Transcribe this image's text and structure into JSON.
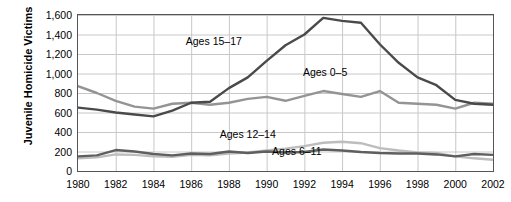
{
  "chart_data": {
    "type": "line",
    "title": "",
    "xlabel": "",
    "ylabel": "Juvenile Homicide Victims",
    "xlim": [
      1980,
      2002
    ],
    "ylim": [
      0,
      1600
    ],
    "grid": true,
    "legend_position": "inline-labels",
    "x": [
      1980,
      1981,
      1982,
      1983,
      1984,
      1985,
      1986,
      1987,
      1988,
      1989,
      1990,
      1991,
      1992,
      1993,
      1994,
      1995,
      1996,
      1997,
      1998,
      1999,
      2000,
      2001,
      2002
    ],
    "xticks": [
      "1980",
      "1982",
      "1984",
      "1986",
      "1988",
      "1990",
      "1992",
      "1994",
      "1996",
      "1998",
      "2000",
      "2002"
    ],
    "yticks": [
      "0",
      "200",
      "400",
      "600",
      "800",
      "1,000",
      "1,200",
      "1,400",
      "1,600"
    ],
    "series": [
      {
        "name": "Ages 15–17",
        "color": "#4a4a4a",
        "values": [
          650,
          630,
          600,
          580,
          560,
          620,
          700,
          710,
          850,
          960,
          1130,
          1290,
          1400,
          1570,
          1540,
          1520,
          1300,
          1110,
          960,
          880,
          730,
          690,
          680
        ]
      },
      {
        "name": "Ages 0–5",
        "color": "#949494",
        "values": [
          870,
          800,
          720,
          660,
          640,
          690,
          700,
          680,
          700,
          740,
          760,
          720,
          770,
          820,
          790,
          760,
          820,
          700,
          690,
          680,
          640,
          700,
          690
        ]
      },
      {
        "name": "Ages 6–11",
        "color": "#5f5f5f",
        "values": [
          150,
          160,
          215,
          200,
          175,
          160,
          180,
          175,
          200,
          185,
          200,
          190,
          195,
          220,
          210,
          195,
          185,
          180,
          180,
          170,
          150,
          175,
          165
        ]
      },
      {
        "name": "Ages 12–14",
        "color": "#bdbdbd",
        "values": [
          130,
          140,
          170,
          165,
          150,
          145,
          165,
          160,
          180,
          190,
          210,
          230,
          255,
          290,
          300,
          285,
          235,
          210,
          190,
          185,
          150,
          130,
          115
        ]
      }
    ],
    "annotations": [
      {
        "text": "Ages 15–17",
        "x": 1987.2,
        "y": 1325
      },
      {
        "text": "Ages 0–5",
        "x": 1993.1,
        "y": 1005
      },
      {
        "text": "Ages 12–14",
        "x": 1989.0,
        "y": 370
      },
      {
        "text": "Ages 6–11",
        "x": 1991.6,
        "y": 190
      }
    ]
  }
}
